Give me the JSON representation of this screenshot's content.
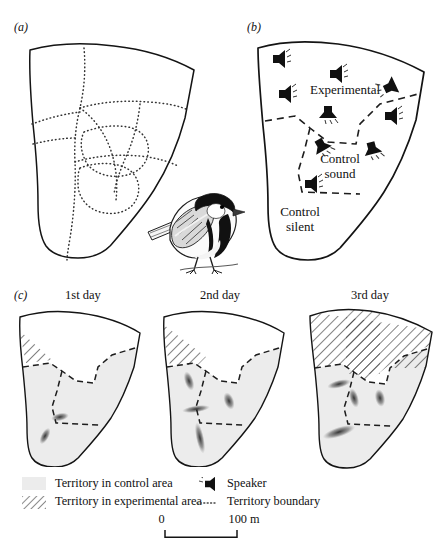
{
  "figure": {
    "panels": [
      {
        "key": "a",
        "label": "(a)",
        "caption": ""
      },
      {
        "key": "b",
        "label": "(b)",
        "caption": ""
      },
      {
        "key": "c",
        "label": "(c)",
        "caption": ""
      }
    ]
  },
  "panel_a": {
    "label": "(a)",
    "description": "study area with dotted territory boundaries"
  },
  "panel_b": {
    "label": "(b)",
    "areas": [
      {
        "name": "experimental",
        "label": "Experimental"
      },
      {
        "name": "control-sound",
        "label": "Control\nsound"
      },
      {
        "name": "control-silent",
        "label": "Control\nsilent"
      }
    ],
    "speaker_count": 9,
    "speakers": [
      {
        "id": 1,
        "x": 31,
        "y": 27
      },
      {
        "id": 2,
        "x": 88,
        "y": 42
      },
      {
        "id": 3,
        "x": 37,
        "y": 62
      },
      {
        "id": 4,
        "x": 142,
        "y": 55
      },
      {
        "id": 5,
        "x": 80,
        "y": 80
      },
      {
        "id": 6,
        "x": 143,
        "y": 84
      },
      {
        "id": 7,
        "x": 73,
        "y": 113
      },
      {
        "id": 8,
        "x": 124,
        "y": 116
      },
      {
        "id": 9,
        "x": 63,
        "y": 152
      }
    ]
  },
  "panel_c": {
    "label": "(c)",
    "maps": [
      {
        "key": "day1",
        "title": "1st day",
        "experimental_hatch": "small"
      },
      {
        "key": "day2",
        "title": "2nd day",
        "experimental_hatch": "medium"
      },
      {
        "key": "day3",
        "title": "3rd day",
        "experimental_hatch": "full"
      }
    ]
  },
  "legend": {
    "items": [
      {
        "key": "control-area",
        "swatch": "gray-fill",
        "label": "Territory in control area"
      },
      {
        "key": "experimental-area",
        "swatch": "diagonal-hatch",
        "label": "Territory in experimental area"
      },
      {
        "key": "speaker",
        "swatch": "speaker-icon",
        "label": "Speaker"
      },
      {
        "key": "territory-boundary",
        "swatch": "dotted-line",
        "label": "Territory boundary"
      }
    ]
  },
  "scale_bar": {
    "start_label": "0",
    "end_label": "100 m"
  },
  "illustration": {
    "name": "great-tit-bird",
    "label": ""
  },
  "colors": {
    "ink": "#141414",
    "territory_fill": "#ececec",
    "hatch": "#1a1a1a",
    "paper": "#ffffff"
  }
}
